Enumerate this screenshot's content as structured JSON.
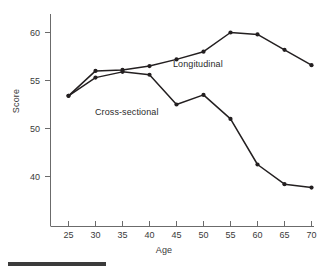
{
  "chart_data": {
    "type": "line",
    "title": "",
    "xlabel": "Age",
    "ylabel": "Score",
    "x": [
      25,
      30,
      35,
      40,
      45,
      50,
      55,
      60,
      65,
      70
    ],
    "xtick_labels": [
      "25",
      "30",
      "35",
      "40",
      "45",
      "50",
      "55",
      "60",
      "65",
      "70"
    ],
    "ytick_labels": [
      "60",
      "55",
      "50",
      "40"
    ],
    "ytick_values": [
      60,
      55,
      50,
      40
    ],
    "xlim": [
      22,
      73
    ],
    "ylim": [
      36,
      61.5
    ],
    "grid": false,
    "legend_position": "inline-annotations",
    "marker": "filled-circle",
    "line_color": "#231f20",
    "series": [
      {
        "name": "Longitudinal",
        "values": [
          53.4,
          56.0,
          56.1,
          56.5,
          57.2,
          58.0,
          60.0,
          59.8,
          58.2,
          56.6
        ]
      },
      {
        "name": "Cross-sectional",
        "values": [
          53.4,
          55.3,
          55.9,
          55.6,
          52.5,
          53.5,
          51.0,
          42.5,
          38.4,
          37.7
        ]
      }
    ],
    "annotations": [
      {
        "text": "Longitudinal",
        "x": 52,
        "y": 57.0
      },
      {
        "text": "Cross-sectional",
        "x": 36,
        "y": 51.6
      }
    ]
  },
  "figure": {
    "axis_title_x": "Age",
    "axis_title_y": "Score",
    "label_longitudinal": "Longitudinal",
    "label_cross_sectional": "Cross-sectional"
  }
}
